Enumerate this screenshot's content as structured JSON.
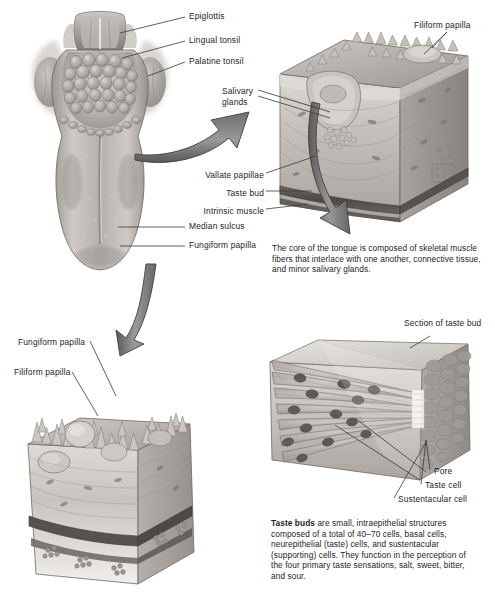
{
  "plate": {
    "title": "Tongue and Taste Buds",
    "background_color": "#ffffff",
    "width": 495,
    "height": 611,
    "ink_color": "#1d1d1d",
    "arrow_color": "#808080",
    "arrow_outline_color": "#3a3a3a"
  },
  "figures": {
    "tongue_dorsum": {
      "name": "Dorsal surface of the tongue",
      "labels": [
        {
          "id": "epiglottis",
          "text": "Epiglottis"
        },
        {
          "id": "lingual-tonsil",
          "text": "Lingual tonsil"
        },
        {
          "id": "palatine-tonsil",
          "text": "Palatine tonsil"
        },
        {
          "id": "median-sulcus",
          "text": "Median sulcus"
        },
        {
          "id": "fungiform-papilla",
          "text": "Fungiform papilla"
        }
      ]
    },
    "tongue_section": {
      "name": "Block section of tongue surface",
      "labels": [
        {
          "id": "filiform-papilla",
          "text": "Filiform papilla"
        },
        {
          "id": "salivary-glands",
          "text": "Salivary\nglands"
        },
        {
          "id": "vallate-papillae",
          "text": "Vallate papillae"
        },
        {
          "id": "taste-bud",
          "text": "Taste bud"
        },
        {
          "id": "intrinsic-muscle",
          "text": "Intrinsic muscle"
        }
      ],
      "caption": "The core of the tongue is composed of skeletal muscle fibers that interlace with one another, connective tissue, and minor salivary glands."
    },
    "papillae_block": {
      "name": "Block section of papillae",
      "labels": [
        {
          "id": "fungiform-papilla-2",
          "text": "Fungiform papilla"
        },
        {
          "id": "filiform-papilla-2",
          "text": "Filiform papilla"
        }
      ]
    },
    "taste_bud_section": {
      "name": "Section of taste bud",
      "title": "Section of taste bud",
      "labels": [
        {
          "id": "pore",
          "text": "Pore"
        },
        {
          "id": "taste-cell",
          "text": "Taste cell"
        },
        {
          "id": "sustentacular-cell",
          "text": "Sustentacular cell"
        }
      ],
      "caption_lead": "Taste buds",
      "caption_rest": " are small, intraepithelial structures composed of a total of 40–70 cells, basal cells, neurepithelial (taste) cells, and sustentacular (supporting) cells. They function in the perception of the four primary taste sensations, salt, sweet, bitter, and sour."
    }
  }
}
